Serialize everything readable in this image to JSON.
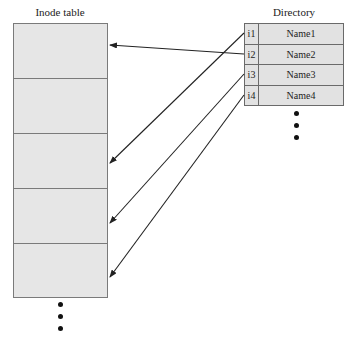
{
  "inode_table": {
    "title": "Inode table",
    "rows": 5,
    "continuation": "ellipsis-dots"
  },
  "directory": {
    "title": "Directory",
    "entries": [
      {
        "inode": "i1",
        "name": "Name1"
      },
      {
        "inode": "i2",
        "name": "Name2"
      },
      {
        "inode": "i3",
        "name": "Name3"
      },
      {
        "inode": "i4",
        "name": "Name4"
      }
    ],
    "continuation": "ellipsis-dots"
  },
  "links": [
    {
      "from": "i2",
      "to_inode_row": 1
    },
    {
      "from": "i1",
      "to_inode_row": 3
    },
    {
      "from": "i3",
      "to_inode_row": 4
    },
    {
      "from": "i4",
      "to_inode_row": 5
    }
  ],
  "colors": {
    "cell_fill": "#e6e6e6",
    "border": "#7a7a7a",
    "arrow": "#222222"
  }
}
